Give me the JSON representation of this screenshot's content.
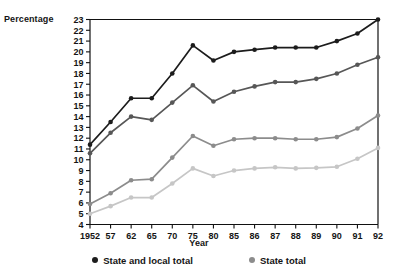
{
  "chart_data": {
    "type": "line",
    "title": "",
    "xlabel": "Year",
    "ylabel": "Percentage",
    "x": [
      "1952",
      "57",
      "62",
      "65",
      "70",
      "75",
      "80",
      "85",
      "86",
      "87",
      "88",
      "89",
      "90",
      "91",
      "92"
    ],
    "categories": [
      "1952",
      "57",
      "62",
      "65",
      "70",
      "75",
      "80",
      "85",
      "86",
      "87",
      "88",
      "89",
      "90",
      "91",
      "92"
    ],
    "ylim": [
      4,
      23
    ],
    "yticks": [
      4,
      5,
      6,
      7,
      8,
      9,
      10,
      11,
      12,
      13,
      14,
      15,
      16,
      17,
      18,
      19,
      20,
      21,
      22,
      23
    ],
    "grid": false,
    "legend_position": "bottom",
    "series": [
      {
        "name": "State and local total",
        "color": "#1c1c1c",
        "values": [
          11.4,
          13.5,
          15.7,
          15.7,
          18.0,
          20.6,
          19.2,
          20.0,
          20.2,
          20.4,
          20.4,
          20.4,
          21.0,
          21.7,
          23.0
        ]
      },
      {
        "name": "State total",
        "color": "#575757",
        "values": [
          10.6,
          12.5,
          14.0,
          13.7,
          15.3,
          16.9,
          15.4,
          16.3,
          16.8,
          17.2,
          17.2,
          17.5,
          18.0,
          18.8,
          19.5
        ]
      },
      {
        "name": "Local total",
        "color": "#8c8c8c",
        "values": [
          5.9,
          6.9,
          8.1,
          8.2,
          10.2,
          12.2,
          11.3,
          11.9,
          12.0,
          12.0,
          11.9,
          11.9,
          12.1,
          12.9,
          14.1
        ]
      },
      {
        "name": "Local own source",
        "color": "#c6c6c6",
        "values": [
          5.0,
          5.7,
          6.5,
          6.5,
          7.8,
          9.2,
          8.5,
          9.0,
          9.2,
          9.3,
          9.2,
          9.25,
          9.35,
          10.1,
          11.1
        ]
      }
    ]
  },
  "legend": {
    "entries": [
      {
        "label": "State and local total",
        "color": "#1c1c1c"
      },
      {
        "label": "State total",
        "color": "#8c8c8c"
      }
    ]
  },
  "axes": {
    "ylabel": "Percentage",
    "xlabel": "Year"
  }
}
